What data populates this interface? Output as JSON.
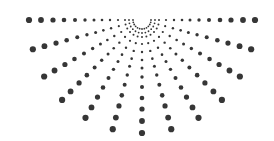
{
  "graphic": {
    "type": "radial-dot-burst",
    "dot_color": "#363636",
    "background": "#ffffff",
    "center": [
      142,
      20
    ],
    "ray_count": 13,
    "angle_start_deg": 0,
    "angle_end_deg": 180,
    "rings": [
      {
        "radius": 9,
        "dot_r": 0.9
      },
      {
        "radius": 13,
        "dot_r": 0.9
      },
      {
        "radius": 17,
        "dot_r": 1.0
      },
      {
        "radius": 24,
        "dot_r": 1.1
      },
      {
        "radius": 32,
        "dot_r": 1.2
      },
      {
        "radius": 40,
        "dot_r": 1.3
      },
      {
        "radius": 48,
        "dot_r": 1.5
      },
      {
        "radius": 57,
        "dot_r": 1.7
      },
      {
        "radius": 67,
        "dot_r": 2.0
      },
      {
        "radius": 78,
        "dot_r": 2.3
      },
      {
        "radius": 89,
        "dot_r": 2.6
      },
      {
        "radius": 101,
        "dot_r": 2.9
      },
      {
        "radius": 113,
        "dot_r": 3.1
      }
    ]
  }
}
